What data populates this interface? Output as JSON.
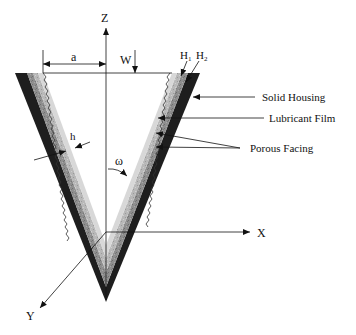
{
  "diagram": {
    "type": "conical porous bearing cross-section",
    "axes": {
      "z_label": "Z",
      "x_label": "X",
      "y_label": "Y"
    },
    "dimensions": {
      "a_label": "a",
      "w_label": "W",
      "h_label": "h",
      "omega_label": "ω",
      "h1_label": "H",
      "h1_sub": "1",
      "h2_label": "H",
      "h2_sub": "2"
    },
    "callouts": [
      {
        "label": "Solid Housing"
      },
      {
        "label": "Lubricant Film"
      },
      {
        "label": "Porous Facing"
      }
    ],
    "colors": {
      "solid_housing": "#1e1e1e",
      "porous_outer": "#8a8a8a",
      "porous_inner": "#b5b5b5",
      "film": "#d6d6d6",
      "line": "#111111"
    }
  }
}
